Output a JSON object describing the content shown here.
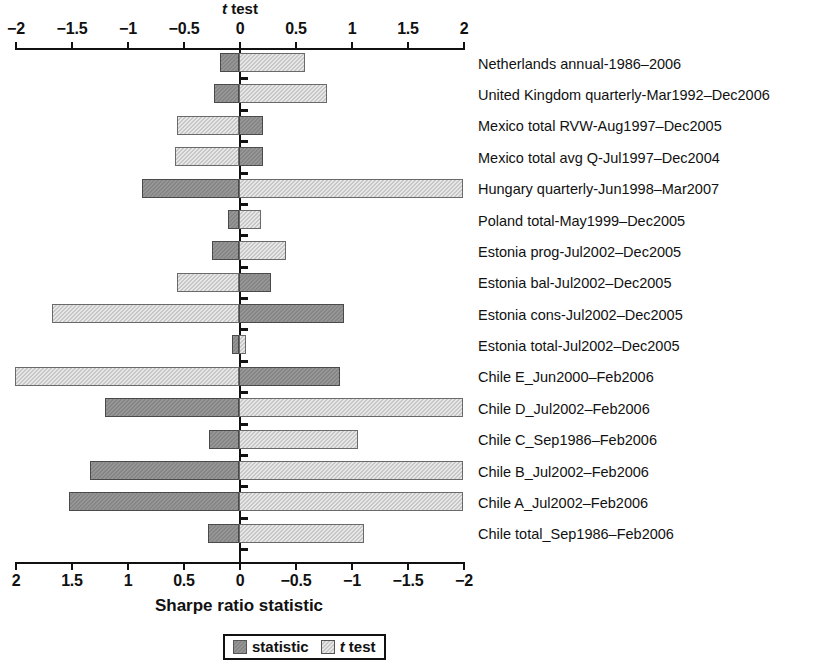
{
  "chart_data": {
    "type": "bar",
    "orientation": "horizontal",
    "title": "",
    "top_axis": {
      "label": "t test",
      "ticks": [
        -2,
        -1.5,
        -1,
        -0.5,
        0,
        0.5,
        1,
        1.5,
        2
      ],
      "tick_labels": [
        "−2",
        "−1.5",
        "−1",
        "−0.5",
        "0",
        "0.5",
        "1",
        "1.5",
        "2"
      ],
      "range": [
        -2,
        2
      ],
      "direction": "normal"
    },
    "bottom_axis": {
      "label": "Sharpe ratio statistic",
      "ticks": [
        2,
        1.5,
        1,
        0.5,
        0,
        -0.5,
        -1,
        -1.5,
        -2
      ],
      "tick_labels": [
        "2",
        "1.5",
        "1",
        "0.5",
        "0",
        "−0.5",
        "−1",
        "−1.5",
        "−2"
      ],
      "range": [
        2,
        -2
      ],
      "direction": "reversed"
    },
    "grid": false,
    "legend_position": "bottom-center",
    "categories": [
      "Netherlands annual-1986–2006",
      "United Kingdom quarterly-Mar1992–Dec2006",
      "Mexico total RVW-Aug1997–Dec2005",
      "Mexico total avg Q-Jul1997–Dec2004",
      "Hungary quarterly-Jun1998–Mar2007",
      "Poland total-May1999–Dec2005",
      "Estonia prog-Jul2002–Dec2005",
      "Estonia bal-Jul2002–Dec2005",
      "Estonia cons-Jul2002–Dec2005",
      "Estonia total-Jul2002–Dec2005",
      "Chile E_Jun2000–Feb2006",
      "Chile D_Jul2002–Feb2006",
      "Chile C_Sep1986–Feb2006",
      "Chile B_Jul2002–Feb2006",
      "Chile A_Jul2002–Feb2006",
      "Chile total_Sep1986–Feb2006"
    ],
    "series": [
      {
        "name": "statistic",
        "axis": "bottom",
        "color": "#8d8d8d",
        "values": [
          0.17,
          0.22,
          -0.21,
          -0.21,
          0.87,
          0.1,
          0.24,
          -0.29,
          -0.94,
          0.06,
          -0.9,
          1.2,
          0.27,
          1.33,
          1.52,
          0.28
        ]
      },
      {
        "name": "t test",
        "axis": "top",
        "color": "#cfcfcf",
        "values": [
          0.59,
          0.79,
          -0.55,
          -0.57,
          2.0,
          0.2,
          0.42,
          -0.55,
          -1.67,
          0.06,
          -2.0,
          2.0,
          1.06,
          2.0,
          2.0,
          1.12
        ]
      }
    ]
  },
  "legend": {
    "items": [
      {
        "label": "statistic",
        "italic_prefix": ""
      },
      {
        "label": " test",
        "italic_prefix": "t"
      }
    ]
  },
  "labels": {
    "top_axis_title_italic": "t",
    "top_axis_title_rest": " test",
    "bottom_axis_title": "Sharpe ratio statistic"
  }
}
